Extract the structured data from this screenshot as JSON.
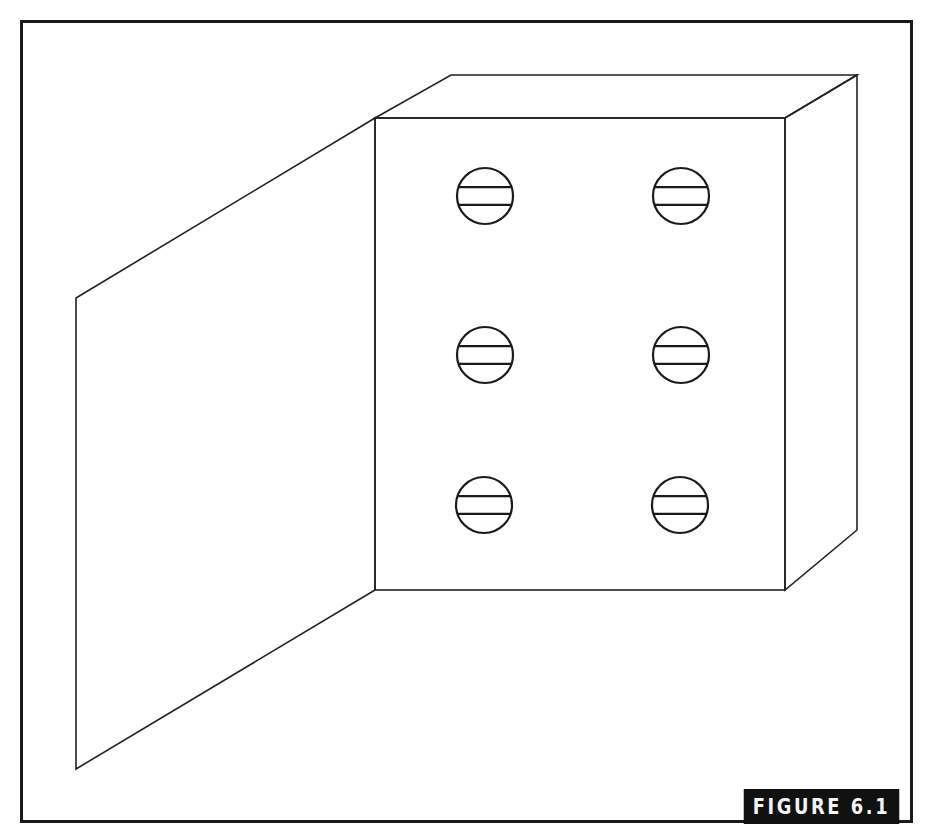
{
  "figure": {
    "caption": "FIGURE 6.1",
    "colors": {
      "line": "#222222",
      "frame": "#1a1a1a",
      "caption_bg": "#111111",
      "caption_text": "#f4f4f4",
      "background": "#ffffff"
    },
    "box": {
      "front_face": {
        "x1": 375,
        "y1": 118,
        "x2": 785,
        "y2": 590
      },
      "back_top_left": [
        451,
        75
      ],
      "back_top_right": [
        857,
        75
      ],
      "back_bottom_right": [
        857,
        530
      ]
    },
    "door": {
      "points": [
        [
          375,
          118
        ],
        [
          76,
          298
        ],
        [
          76,
          769
        ],
        [
          375,
          590
        ]
      ]
    },
    "screws": [
      {
        "id": "screw-top-left",
        "cx": 485,
        "cy": 196,
        "r": 28
      },
      {
        "id": "screw-top-right",
        "cx": 681,
        "cy": 196,
        "r": 28
      },
      {
        "id": "screw-middle-left",
        "cx": 485,
        "cy": 355,
        "r": 28
      },
      {
        "id": "screw-middle-right",
        "cx": 681,
        "cy": 355,
        "r": 28
      },
      {
        "id": "screw-bottom-left",
        "cx": 484,
        "cy": 505,
        "r": 28
      },
      {
        "id": "screw-bottom-right",
        "cx": 680,
        "cy": 505,
        "r": 28
      }
    ]
  }
}
